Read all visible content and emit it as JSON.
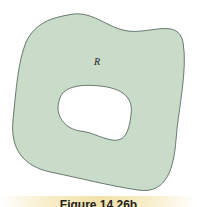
{
  "figure": {
    "region_label": "R",
    "caption": "Figure 14.26b",
    "colors": {
      "region_fill": "#c9dcc9",
      "outline": "#4a5a52",
      "hole_fill": "#ffffff",
      "caption_band": "#f3e2a8"
    }
  }
}
